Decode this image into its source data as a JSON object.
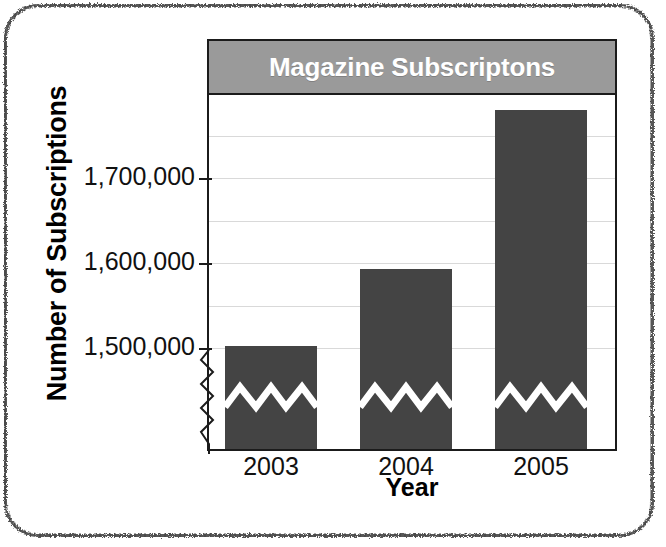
{
  "chart_data": {
    "type": "bar",
    "title": "Magazine Subscriptons",
    "xlabel": "Year",
    "ylabel": "Number of Subscriptions",
    "categories": [
      "2003",
      "2004",
      "2005"
    ],
    "values": [
      1502000,
      1593000,
      1780000
    ],
    "series": [
      {
        "name": "Subscriptions",
        "values": [
          1502000,
          1593000,
          1780000
        ]
      }
    ],
    "ytick_labels": [
      "1,500,000",
      "1,600,000",
      "1,700,000"
    ],
    "ytick_values": [
      1500000,
      1600000,
      1700000
    ],
    "ylim": [
      1450000,
      1810000
    ],
    "y_axis_break": true,
    "y_axis_break_note": "axis broken below 1,500,000; bars also show zigzag break",
    "gridlines": true,
    "gridline_interval": 50000,
    "legend": "none",
    "legend_position": "none",
    "bar_fill_color": "#444444",
    "title_band_color": "#9a9a9a",
    "title_text_color": "#ffffff",
    "gridline_color": "#d9d9d9",
    "axis_color": "#1b1b1b",
    "plot_background": "#ffffff"
  }
}
